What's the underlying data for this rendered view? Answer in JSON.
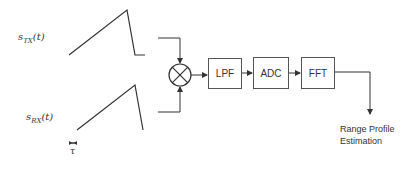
{
  "signals": {
    "tx": {
      "symbol": "s",
      "subscript": "TX",
      "arg": "(t)"
    },
    "rx": {
      "symbol": "s",
      "subscript": "RX",
      "arg": "(t)"
    },
    "delay_label": "τ"
  },
  "blocks": [
    {
      "id": "mixer",
      "label": "⊗"
    },
    {
      "id": "lpf",
      "label": "LPF"
    },
    {
      "id": "adc",
      "label": "ADC"
    },
    {
      "id": "fft",
      "label": "FFT"
    }
  ],
  "output": {
    "line1": "Range Profile",
    "line2": "Estimation"
  },
  "colors": {
    "stroke": "#333333",
    "background": "#ffffff"
  }
}
